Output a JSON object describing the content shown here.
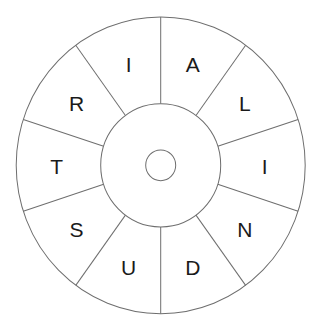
{
  "puzzle": {
    "type": "word-wheel",
    "sectors": 10,
    "start_angle_deg": 0,
    "letters": [
      "A",
      "L",
      "I",
      "N",
      "D",
      "U",
      "S",
      "T",
      "R",
      "I"
    ],
    "center_letter": ""
  },
  "style": {
    "line_color": "#6e6e6e",
    "letter_color": "#1a1a1a",
    "background": "#ffffff"
  }
}
